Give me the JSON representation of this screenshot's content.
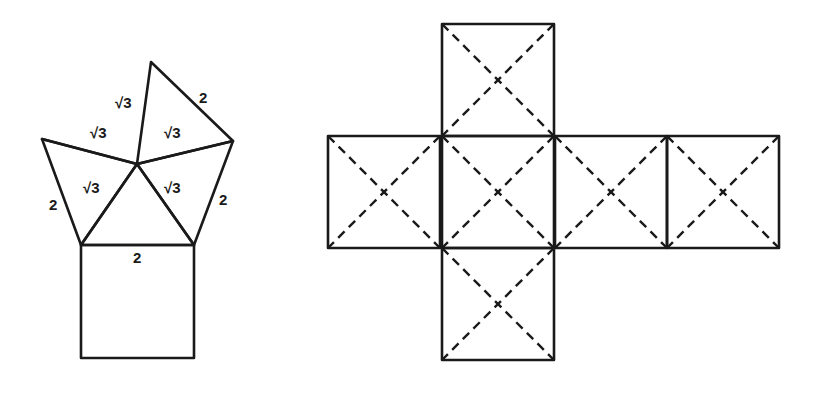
{
  "figure_left": {
    "description": "Square with four adjacent triangles meeting at an apex (unfolded pyramid-like net)",
    "square": {
      "x": 81,
      "y": 245,
      "size": 113
    },
    "vertices": {
      "apex": [
        137,
        164
      ],
      "top": [
        151,
        62
      ],
      "right": [
        233,
        141
      ],
      "left": [
        42,
        139
      ],
      "bottom_left": [
        81,
        245
      ],
      "bottom_right": [
        194,
        245
      ]
    },
    "labels": [
      {
        "text": "√3",
        "x": 115,
        "y": 108
      },
      {
        "text": "2",
        "x": 199,
        "y": 103
      },
      {
        "text": "√3",
        "x": 90,
        "y": 138
      },
      {
        "text": "√3",
        "x": 164,
        "y": 138
      },
      {
        "text": "√3",
        "x": 83,
        "y": 193
      },
      {
        "text": "√3",
        "x": 164,
        "y": 193
      },
      {
        "text": "2",
        "x": 49,
        "y": 210
      },
      {
        "text": "2",
        "x": 219,
        "y": 205
      },
      {
        "text": "2",
        "x": 133,
        "y": 263
      }
    ]
  },
  "figure_right": {
    "description": "Cross-shaped cube net of six squares, each with dashed diagonals",
    "squares": [
      {
        "name": "top",
        "x": 442,
        "y": 24,
        "size": 112
      },
      {
        "name": "left",
        "x": 328,
        "y": 136,
        "size": 112
      },
      {
        "name": "center",
        "x": 442,
        "y": 136,
        "size": 112
      },
      {
        "name": "right",
        "x": 555,
        "y": 136,
        "size": 112
      },
      {
        "name": "far-right",
        "x": 667,
        "y": 136,
        "size": 112
      },
      {
        "name": "bottom",
        "x": 442,
        "y": 248,
        "size": 112
      }
    ]
  },
  "colors": {
    "line": "#1a1a1a",
    "background": "#ffffff"
  }
}
